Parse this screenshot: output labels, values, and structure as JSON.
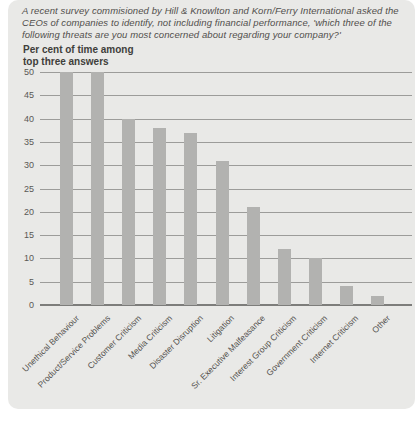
{
  "panel": {
    "bg": "#e9e9e7"
  },
  "header": {
    "lines": [
      "A recent survey commisioned by Hill & Knowlton and Korn/Ferry International asked the",
      "CEOs of companies to identify, not including financial performance, 'which three of the",
      "following threats are you most concerned about regarding your company?'"
    ]
  },
  "chart_data": {
    "type": "bar",
    "title": "Per cent of time among top three answers",
    "title_lines": [
      "Per cent of time among",
      "top three answers"
    ],
    "categories": [
      "Unethical Behaviour",
      "Product/Service Problems",
      "Customer Criticism",
      "Media Criticism",
      "Disaster Disruption",
      "Litigation",
      "Sr. Executive Malfeasance",
      "Interest Group Criticism",
      "Government Criticism",
      "Internet Criticism",
      "Other"
    ],
    "values": [
      50,
      50,
      40,
      38,
      37,
      31,
      21,
      12,
      10,
      4,
      2
    ],
    "xlabel": "",
    "ylabel": "",
    "ylim": [
      0,
      50
    ],
    "yticks": [
      0,
      5,
      10,
      15,
      20,
      25,
      30,
      35,
      40,
      45,
      50
    ],
    "grid": true,
    "legend": "none",
    "bar_color": "#b2b2b0",
    "gridline_color": "#9c9c9a",
    "axis_color": "#7d7d7b",
    "text_color": "#55534f"
  }
}
